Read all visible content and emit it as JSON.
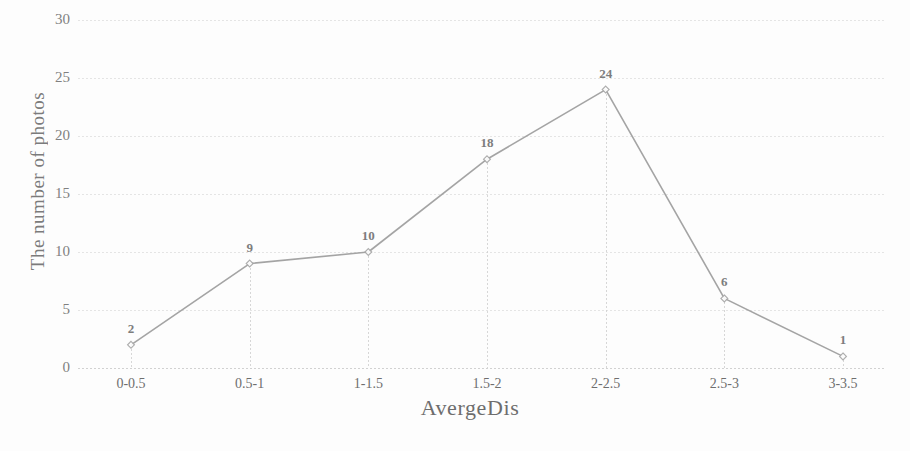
{
  "chart_data": {
    "type": "line",
    "title": "",
    "xlabel": "AvergeDis",
    "ylabel": "The number of photos",
    "categories": [
      "0-0.5",
      "0.5-1",
      "1-1.5",
      "1.5-2",
      "2-2.5",
      "2.5-3",
      "3-3.5"
    ],
    "values": [
      2,
      9,
      10,
      18,
      24,
      6,
      1
    ],
    "data_labels": [
      "2",
      "9",
      "10",
      "18",
      "24",
      "6",
      "1"
    ],
    "ylim": [
      0,
      30
    ],
    "yticks": [
      "0",
      "5",
      "10",
      "15",
      "20",
      "25",
      "30"
    ],
    "ytick_values": [
      0,
      5,
      10,
      15,
      20,
      25,
      30
    ],
    "grid": true,
    "grid_axis": "y",
    "legend": false,
    "legend_position": "none",
    "series": [
      {
        "name": "The number of photos",
        "values": [
          2,
          9,
          10,
          18,
          24,
          6,
          1
        ],
        "marker": "diamond",
        "line_color": "#9a9a9a",
        "marker_color": "#a8a8a8"
      }
    ],
    "drop_lines": true,
    "colors": {
      "line": "#9a9a9a",
      "marker": "#a8a8a8",
      "grid": "#dcdcdc",
      "baseline": "#cfcfcf",
      "text": "#5f5f5f",
      "label": "#707070",
      "background": "#fdfdfd"
    }
  }
}
